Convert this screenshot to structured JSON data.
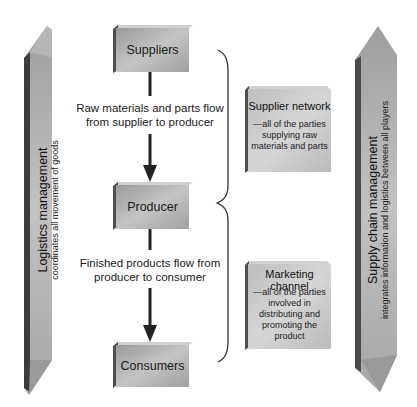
{
  "diagram": {
    "nodes": {
      "suppliers": {
        "label": "Suppliers"
      },
      "producer": {
        "label": "Producer"
      },
      "consumers": {
        "label": "Consumers"
      }
    },
    "flows": {
      "raw_materials": {
        "line1": "Raw materials and parts flow",
        "line2": "from supplier to producer"
      },
      "finished_products": {
        "line1": "Finished products flow from",
        "line2": "producer to consumer"
      }
    },
    "groups": {
      "supplier_network": {
        "title": "Supplier network",
        "desc_lines": [
          "—all of the parties",
          "supplying raw",
          "materials and parts"
        ]
      },
      "marketing_channel": {
        "title": "Marketing channel",
        "desc_lines": [
          "—all of the parties",
          "involved in",
          "distributing and",
          "promoting the",
          "product"
        ]
      }
    },
    "pillars": {
      "logistics": {
        "title": "Logistics management",
        "subtitle": "coordinates all movement of goods"
      },
      "supply_chain": {
        "title": "Supply chain management",
        "subtitle": "integrates information and logistics between all players"
      }
    },
    "colors": {
      "box_face": "#a8a8a8",
      "box_dark": "#555555",
      "pillar_face": "#b0b0b0",
      "pillar_dark": "#3a3a3a",
      "arrow": "#222222"
    }
  }
}
